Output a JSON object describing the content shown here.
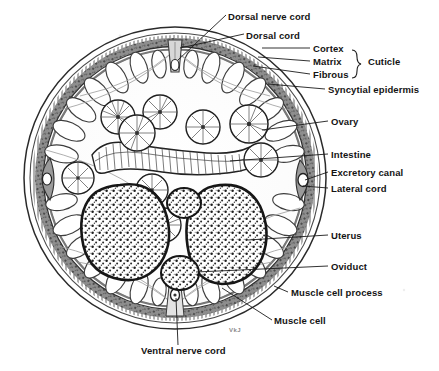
{
  "figure": {
    "signature": "VkJ",
    "ink_color": "#1a1a1a",
    "paper_color": "#ffffff",
    "wall_color": "#5a5a5a",
    "circle": {
      "cx": 175,
      "cy": 178,
      "r": 152
    }
  },
  "labels": {
    "dorsal_nerve_cord": "Dorsal nerve cord",
    "dorsal_cord": "Dorsal cord",
    "cortex": "Cortex",
    "matrix": "Matrix",
    "fibrous": "Fibrous",
    "cuticle": "Cuticle",
    "syncytial_epidermis": "Syncytial epidermis",
    "ovary": "Ovary",
    "intestine": "Intestine",
    "excretory_canal": "Excretory canal",
    "lateral_cord": "Lateral cord",
    "uterus": "Uterus",
    "oviduct": "Oviduct",
    "muscle_cell_process": "Muscle cell process",
    "muscle_cell": "Muscle cell",
    "ventral_nerve_cord": "Ventral nerve cord"
  },
  "label_positions": {
    "dorsal_nerve_cord": {
      "x": 228,
      "y": 12
    },
    "dorsal_cord": {
      "x": 246,
      "y": 31
    },
    "cortex": {
      "x": 313,
      "y": 51
    },
    "matrix": {
      "x": 313,
      "y": 64
    },
    "fibrous": {
      "x": 313,
      "y": 77
    },
    "cuticle": {
      "x": 368,
      "y": 64
    },
    "syncytial_epidermis": {
      "x": 328,
      "y": 92
    },
    "ovary": {
      "x": 331,
      "y": 124
    },
    "intestine": {
      "x": 331,
      "y": 157
    },
    "excretory_canal": {
      "x": 331,
      "y": 175
    },
    "lateral_cord": {
      "x": 331,
      "y": 191
    },
    "uterus": {
      "x": 331,
      "y": 238
    },
    "oviduct": {
      "x": 331,
      "y": 269
    },
    "muscle_cell_process": {
      "x": 291,
      "y": 295
    },
    "muscle_cell": {
      "x": 274,
      "y": 323
    },
    "ventral_nerve_cord": {
      "x": 141,
      "y": 353
    },
    "signature": {
      "x": 229,
      "y": 327
    }
  },
  "structures": {
    "ovary_count": 8,
    "uterus_count": 2,
    "oviduct_count": 2,
    "intestine_shape": "wavy beaded ribbon",
    "muscle_cell_rows": "petal-shaped cells lining body wall"
  }
}
